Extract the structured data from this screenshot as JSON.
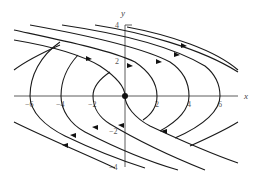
{
  "figure": {
    "type": "phase-portrait",
    "axes": {
      "x_label": "x",
      "y_label": "y",
      "x_ticks": [
        "−6",
        "−4",
        "−2",
        "2",
        "4",
        "6"
      ],
      "y_ticks": [
        "4",
        "2",
        "−2",
        "−4"
      ]
    },
    "equilibrium": "origin",
    "colors": {
      "curve": "#1a1a1a",
      "axis": "#333333",
      "label": "#555555"
    }
  }
}
